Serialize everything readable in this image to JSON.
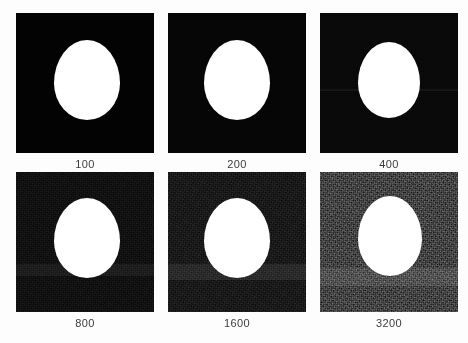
{
  "figure": {
    "kind": "iso-noise-comparison-contact-sheet",
    "background_color": "#fdfdfd",
    "caption_color": "#3b3b3b",
    "subject_color": "#ffffff",
    "columns": 3,
    "rows": 2
  },
  "panels": [
    {
      "label": "100",
      "x": 16,
      "y": 13,
      "width": 138,
      "height": 140,
      "base_color": "#030303",
      "noise_level": 0,
      "noise_opacity": 0.0,
      "band": {
        "visible": false,
        "top": 0,
        "height": 0,
        "color": "rgba(255,255,255,0)"
      },
      "blob": {
        "left": 38,
        "top": 27,
        "width": 66,
        "height": 80
      }
    },
    {
      "label": "200",
      "x": 168,
      "y": 13,
      "width": 138,
      "height": 140,
      "base_color": "#040404",
      "noise_level": 1,
      "noise_opacity": 0.07,
      "band": {
        "visible": false,
        "top": 0,
        "height": 0,
        "color": "rgba(255,255,255,0)"
      },
      "blob": {
        "left": 36,
        "top": 27,
        "width": 66,
        "height": 80
      }
    },
    {
      "label": "400",
      "x": 320,
      "y": 13,
      "width": 138,
      "height": 140,
      "base_color": "#060606",
      "noise_level": 2,
      "noise_opacity": 0.12,
      "band": {
        "visible": true,
        "top": 76,
        "height": 2,
        "color": "rgba(255,255,255,0.05)"
      },
      "blob": {
        "left": 38,
        "top": 29,
        "width": 62,
        "height": 76
      }
    },
    {
      "label": "800",
      "x": 16,
      "y": 172,
      "width": 138,
      "height": 140,
      "base_color": "#080808",
      "noise_level": 3,
      "noise_opacity": 0.22,
      "band": {
        "visible": true,
        "top": 92,
        "height": 12,
        "color": "rgba(255,255,255,0.055)"
      },
      "blob": {
        "left": 38,
        "top": 26,
        "width": 66,
        "height": 80
      }
    },
    {
      "label": "1600",
      "x": 168,
      "y": 172,
      "width": 138,
      "height": 140,
      "base_color": "#0b0b0b",
      "noise_level": 4,
      "noise_opacity": 0.38,
      "band": {
        "visible": true,
        "top": 92,
        "height": 16,
        "color": "rgba(255,255,255,0.075)"
      },
      "blob": {
        "left": 36,
        "top": 26,
        "width": 66,
        "height": 80
      }
    },
    {
      "label": "3200",
      "x": 320,
      "y": 172,
      "width": 138,
      "height": 140,
      "base_color": "#171717",
      "noise_level": 5,
      "noise_opacity": 1.0,
      "band": {
        "visible": true,
        "top": 96,
        "height": 18,
        "color": "rgba(255,255,255,0.085)"
      },
      "blob": {
        "left": 38,
        "top": 24,
        "width": 64,
        "height": 80
      }
    }
  ],
  "captions": {
    "y_row1": 157,
    "y_row2": 317
  }
}
